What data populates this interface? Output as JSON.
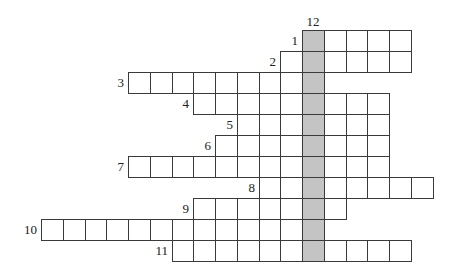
{
  "puzzle": {
    "type": "crossword",
    "origin_x": 41,
    "origin_y": 30,
    "cell_w": 21.75,
    "cell_h": 21,
    "shaded_column": 12,
    "shaded_color": "#c4c4c4",
    "vertical_word": {
      "number": "12",
      "col": 12,
      "row_start": 0,
      "row_end": 10
    },
    "rows": [
      {
        "number": "1",
        "row": 0,
        "col_start": 12,
        "col_end": 16
      },
      {
        "number": "2",
        "row": 1,
        "col_start": 11,
        "col_end": 16
      },
      {
        "number": "3",
        "row": 2,
        "col_start": 4,
        "col_end": 12
      },
      {
        "number": "4",
        "row": 3,
        "col_start": 7,
        "col_end": 15
      },
      {
        "number": "5",
        "row": 4,
        "col_start": 9,
        "col_end": 15
      },
      {
        "number": "6",
        "row": 5,
        "col_start": 8,
        "col_end": 15
      },
      {
        "number": "7",
        "row": 6,
        "col_start": 4,
        "col_end": 15
      },
      {
        "number": "8",
        "row": 7,
        "col_start": 10,
        "col_end": 17
      },
      {
        "number": "9",
        "row": 8,
        "col_start": 7,
        "col_end": 13
      },
      {
        "number": "10",
        "row": 9,
        "col_start": 0,
        "col_end": 12
      },
      {
        "number": "11",
        "row": 10,
        "col_start": 6,
        "col_end": 16
      }
    ]
  }
}
